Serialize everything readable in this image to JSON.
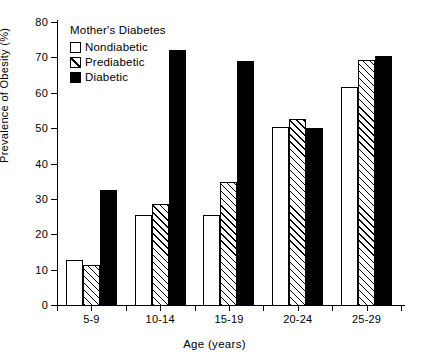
{
  "chart_data": {
    "type": "bar",
    "title": "",
    "xlabel": "Age (years)",
    "ylabel": "Prevalence of Obesity (%)",
    "categories": [
      "5-9",
      "10-14",
      "15-19",
      "20-24",
      "25-29"
    ],
    "series": [
      {
        "name": "Nondiabetic",
        "values": [
          12.8,
          25.5,
          25.4,
          50.2,
          61.5
        ]
      },
      {
        "name": "Prediabetic",
        "values": [
          11.3,
          28.5,
          34.8,
          52.6,
          69.2
        ]
      },
      {
        "name": "Diabetic",
        "values": [
          32.4,
          72.0,
          69.0,
          50.1,
          70.3
        ]
      }
    ],
    "ylim": [
      0,
      80
    ],
    "yticks": [
      0,
      10,
      20,
      30,
      40,
      50,
      60,
      70,
      80
    ],
    "ytick_labels": [
      "0",
      "10",
      "20",
      "30",
      "40",
      "50",
      "60",
      "70",
      "80"
    ],
    "grid": false,
    "legend_position": "upper-left",
    "legend_title": "Mother's Diabetes",
    "colors": {
      "nondiabetic": "#ffffff",
      "prediabetic": "#ffffff",
      "diabetic": "#000000",
      "outline": "#000000",
      "background": "#ffffff"
    }
  },
  "legend": {
    "title": "Mother's Diabetes",
    "entries": [
      {
        "label": "Nondiabetic",
        "pattern": "open"
      },
      {
        "label": "Prediabetic",
        "pattern": "hatched"
      },
      {
        "label": "Diabetic",
        "pattern": "filled"
      }
    ]
  },
  "axes": {
    "x_title": "Age (years)",
    "y_title": "Prevalence of Obesity (%)"
  }
}
